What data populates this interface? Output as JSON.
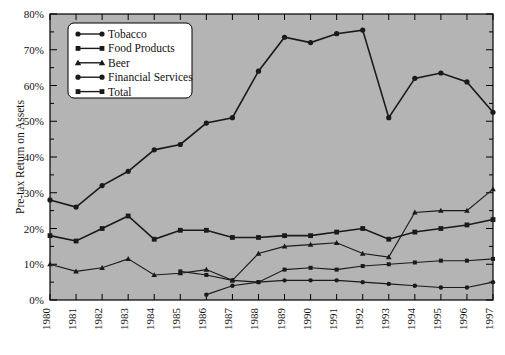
{
  "chart_data": {
    "type": "line",
    "title": "",
    "xlabel": "",
    "ylabel": "Pre-tax Return on Assets",
    "x": [
      1980,
      1981,
      1982,
      1983,
      1984,
      1985,
      1986,
      1987,
      1988,
      1989,
      1990,
      1991,
      1992,
      1993,
      1994,
      1995,
      1996,
      1997
    ],
    "categories": [
      "1980",
      "1981",
      "1982",
      "1983",
      "1984",
      "1985",
      "1986",
      "1987",
      "1988",
      "1989",
      "1990",
      "1991",
      "1992",
      "1993",
      "1994",
      "1995",
      "1996",
      "1997"
    ],
    "ylim": [
      0,
      80
    ],
    "yticks": [
      0,
      10,
      20,
      30,
      40,
      50,
      60,
      70,
      80
    ],
    "ytick_labels": [
      "0%",
      "10%",
      "20%",
      "30%",
      "40%",
      "50%",
      "60%",
      "70%",
      "80%"
    ],
    "yminor_step": 5,
    "grid": false,
    "legend_position": "top-left",
    "plot_background": "#b4b4b4",
    "line_color": "#1a1a1a",
    "series": [
      {
        "name": "Tobacco",
        "marker": "circle",
        "x": [
          1980,
          1981,
          1982,
          1983,
          1984,
          1985,
          1986,
          1987,
          1988,
          1989,
          1990,
          1991,
          1992,
          1993,
          1994,
          1995,
          1996,
          1997
        ],
        "values": [
          28.0,
          26.0,
          32.0,
          36.0,
          42.0,
          43.5,
          49.5,
          51.0,
          64.0,
          73.5,
          72.0,
          74.5,
          75.5,
          51.0,
          62.0,
          63.5,
          61.0,
          52.5
        ]
      },
      {
        "name": "Food Products",
        "marker": "square",
        "x": [
          1985,
          1986,
          1987,
          1988,
          1989,
          1990,
          1991,
          1992,
          1993,
          1994,
          1995,
          1996,
          1997
        ],
        "values": [
          8.0,
          7.0,
          5.5,
          5.0,
          8.5,
          9.0,
          8.5,
          9.5,
          10.0,
          10.5,
          11.0,
          11.0,
          11.5
        ]
      },
      {
        "name": "Beer",
        "marker": "triangle",
        "x": [
          1980,
          1981,
          1982,
          1983,
          1984,
          1985,
          1986,
          1987,
          1988,
          1989,
          1990,
          1991,
          1992,
          1993,
          1994,
          1995,
          1996,
          1997
        ],
        "values": [
          10.0,
          8.0,
          9.0,
          11.5,
          7.0,
          7.5,
          8.5,
          5.5,
          13.0,
          15.0,
          15.5,
          16.0,
          13.0,
          12.0,
          24.5,
          25.0,
          25.0,
          31.0
        ]
      },
      {
        "name": "Financial Services",
        "marker": "circle",
        "x": [
          1986,
          1987,
          1988,
          1989,
          1990,
          1991,
          1992,
          1993,
          1994,
          1995,
          1996,
          1997
        ],
        "values": [
          1.5,
          4.0,
          5.0,
          5.5,
          5.5,
          5.5,
          5.0,
          4.5,
          4.0,
          3.5,
          3.5,
          5.0
        ]
      },
      {
        "name": "Total",
        "marker": "square",
        "x": [
          1980,
          1981,
          1982,
          1983,
          1984,
          1985,
          1986,
          1987,
          1988,
          1989,
          1990,
          1991,
          1992,
          1993,
          1994,
          1995,
          1996,
          1997
        ],
        "values": [
          18.0,
          16.5,
          20.0,
          23.5,
          17.0,
          19.5,
          19.5,
          17.5,
          17.5,
          18.0,
          18.0,
          19.0,
          20.0,
          17.0,
          19.0,
          20.0,
          21.0,
          22.5
        ]
      }
    ]
  },
  "legend": {
    "entries": [
      {
        "label": "Tobacco"
      },
      {
        "label": "Food Products"
      },
      {
        "label": "Beer"
      },
      {
        "label": "Financial Services"
      },
      {
        "label": "Total"
      }
    ]
  },
  "axes": {
    "y_title": "Pre-tax Return on Assets"
  }
}
